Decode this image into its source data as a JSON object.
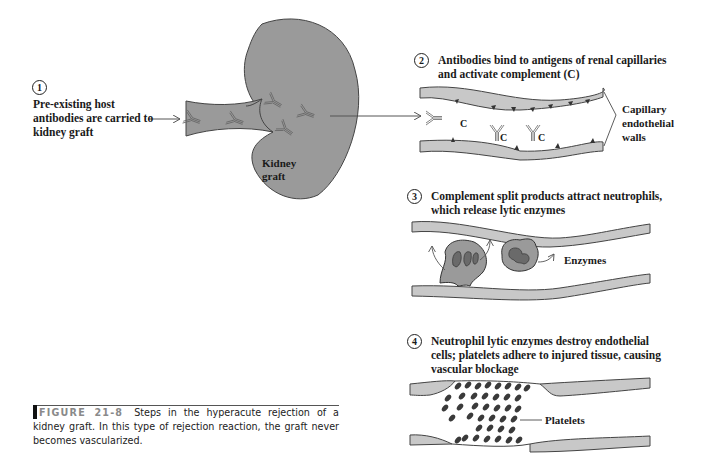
{
  "steps": [
    {
      "number": "1",
      "text_lines": [
        "Pre-existing host",
        "antibodies are carried to",
        "kidney graft"
      ]
    },
    {
      "number": "2",
      "text_lines": [
        "Antibodies bind to antigens of renal capillaries",
        "and activate complement (C)"
      ]
    },
    {
      "number": "3",
      "text_lines": [
        "Complement split products attract neutrophils,",
        "which release lytic enzymes"
      ]
    },
    {
      "number": "4",
      "text_lines": [
        "Neutrophil lytic enzymes destroy endothelial",
        "cells; platelets adhere to injured tissue, causing",
        "vascular blockage"
      ]
    }
  ],
  "labels": {
    "kidney_line1": "Kidney",
    "kidney_line2": "graft",
    "capillary_line1": "Capillary",
    "capillary_line2": "endothelial",
    "capillary_line3": "walls",
    "complement": "C",
    "enzymes": "Enzymes",
    "platelets": "Platelets"
  },
  "caption": {
    "figure_label": "FIGURE 21-8",
    "text": "Steps in the hyperacute rejection of a kidney graft. In this type of rejection reaction, the graft never becomes vascularized."
  },
  "colors": {
    "tissue_gray": "#9a9a9a",
    "wall_gray": "#c8c8c8",
    "platelet_dark": "#3a3a3a",
    "outline": "#333333"
  }
}
